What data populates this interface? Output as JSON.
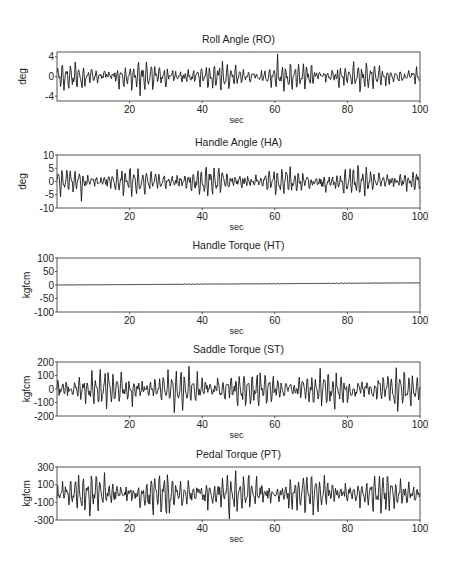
{
  "figure": {
    "width": 455,
    "height": 570,
    "line_color": "#1a1a1a",
    "frame_color": "#555555"
  },
  "chart_data": [
    {
      "type": "line",
      "id": "roll-angle",
      "title": "Roll Angle (RO)",
      "xlabel": "sec",
      "ylabel": "deg",
      "xlim": [
        0,
        100
      ],
      "ylim": [
        -5,
        5
      ],
      "xticks": [
        20,
        40,
        60,
        80,
        100
      ],
      "yticks": [
        4,
        0,
        -4
      ],
      "ytick_labels": [
        "4",
        "0",
        "-4"
      ],
      "grid": false,
      "legend": null,
      "frame": {
        "top": 52,
        "bottom": 101
      },
      "signal": {
        "amplitude": 2.0,
        "peak": 4.6,
        "seed": 11,
        "drift": 0
      },
      "series": [
        {
          "name": "RO",
          "description": "oscillating roll angle, mostly within ±3 deg, peaks near ±4.5 deg"
        }
      ]
    },
    {
      "type": "line",
      "id": "handle-angle",
      "title": "Handle Angle (HA)",
      "xlabel": "sec",
      "ylabel": "deg",
      "xlim": [
        0,
        100
      ],
      "ylim": [
        -10,
        10
      ],
      "xticks": [
        20,
        40,
        60,
        80,
        100
      ],
      "yticks": [
        10,
        5,
        0,
        -5,
        -10
      ],
      "ytick_labels": [
        "10",
        "5",
        "0",
        "-5",
        "-10"
      ],
      "grid": false,
      "legend": null,
      "frame": {
        "top": 155,
        "bottom": 208
      },
      "signal": {
        "amplitude": 3.6,
        "peak": 8.5,
        "seed": 23,
        "drift": 0
      },
      "series": [
        {
          "name": "HA",
          "description": "oscillating handle angle, mostly within ±5 deg, peaks near ±8 deg"
        }
      ]
    },
    {
      "type": "line",
      "id": "handle-torque",
      "title": "Handle Torque (HT)",
      "xlabel": "sec",
      "ylabel": "kgfcm",
      "xlim": [
        0,
        100
      ],
      "ylim": [
        -100,
        100
      ],
      "xticks": [
        20,
        40,
        60,
        80,
        100
      ],
      "yticks": [
        100,
        50,
        0,
        -50,
        -100
      ],
      "ytick_labels": [
        "100",
        "50",
        "0",
        "-50",
        "-100"
      ],
      "grid": false,
      "legend": null,
      "frame": {
        "top": 258,
        "bottom": 312
      },
      "signal": {
        "amplitude": 0.8,
        "peak": 2.5,
        "seed": 37,
        "drift": 8
      },
      "series": [
        {
          "name": "HT",
          "description": "near-zero torque, slowly drifting from ~0 to ~8 kgfcm at 100 sec"
        }
      ]
    },
    {
      "type": "line",
      "id": "saddle-torque",
      "title": "Saddle Torque (ST)",
      "xlabel": "sec",
      "ylabel": "kgfcm",
      "xlim": [
        0,
        100
      ],
      "ylim": [
        -200,
        200
      ],
      "xticks": [
        20,
        40,
        60,
        80,
        100
      ],
      "yticks": [
        200,
        100,
        0,
        -100,
        -200
      ],
      "ytick_labels": [
        "200",
        "100",
        "0",
        "-100",
        "-200"
      ],
      "grid": false,
      "legend": null,
      "frame": {
        "top": 362,
        "bottom": 416
      },
      "signal": {
        "amplitude": 95,
        "peak": 200,
        "seed": 53,
        "drift": 0
      },
      "series": [
        {
          "name": "ST",
          "description": "dense oscillation, mostly within ±150 kgfcm, peaks reaching ±200"
        }
      ]
    },
    {
      "type": "line",
      "id": "pedal-torque",
      "title": "Pedal Torque (PT)",
      "xlabel": "sec",
      "ylabel": "kgfcm",
      "xlim": [
        0,
        100
      ],
      "ylim": [
        -300,
        300
      ],
      "xticks": [
        20,
        40,
        60,
        80,
        100
      ],
      "yticks": [
        300,
        100,
        -100,
        -300
      ],
      "ytick_labels": [
        "300",
        "100",
        "-100",
        "-300"
      ],
      "grid": false,
      "legend": null,
      "frame": {
        "top": 467,
        "bottom": 520
      },
      "signal": {
        "amplitude": 150,
        "peak": 300,
        "seed": 71,
        "drift": 0
      },
      "series": [
        {
          "name": "PT",
          "description": "dense oscillation, mostly within ±250 kgfcm, frequently clipping at ±300"
        }
      ]
    }
  ],
  "layout": {
    "plot_left": 57,
    "plot_right": 420,
    "samples": 520
  }
}
